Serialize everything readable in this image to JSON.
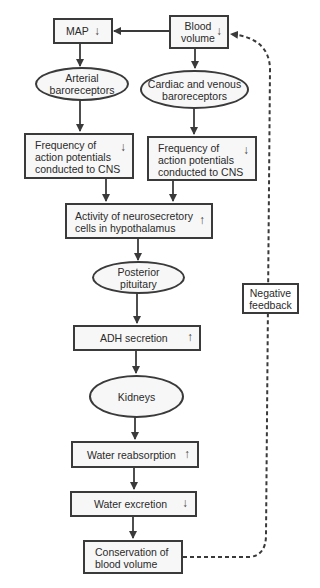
{
  "nodes": {
    "map": {
      "label": "MAP",
      "direction": "down"
    },
    "blood_volume": {
      "label_line1": "Blood",
      "label_line2": "volume",
      "direction": "down"
    },
    "arterial_baroreceptors": {
      "line1": "Arterial",
      "line2": "baroreceptors"
    },
    "cardiac_venous_baroreceptors": {
      "line1": "Cardiac and venous",
      "line2": "baroreceptors"
    },
    "freq_left": {
      "line1": "Frequency of",
      "line2": "action potentials",
      "line3": "conducted to CNS",
      "direction": "down"
    },
    "freq_right": {
      "line1": "Frequency of",
      "line2": "action potentials",
      "line3": "conducted to CNS",
      "direction": "down"
    },
    "neurosecretory": {
      "line1": "Activity of neurosecretory",
      "line2": "cells in hypothalamus",
      "direction": "up"
    },
    "posterior_pituitary": {
      "line1": "Posterior",
      "line2": "pituitary"
    },
    "adh_secretion": {
      "label": "ADH secretion",
      "direction": "up"
    },
    "kidneys": {
      "label": "Kidneys"
    },
    "water_reabsorption": {
      "label": "Water reabsorption",
      "direction": "up"
    },
    "water_excretion": {
      "label": "Water excretion",
      "direction": "down"
    },
    "conservation": {
      "line1": "Conservation of",
      "line2": "blood volume"
    },
    "negative_feedback": {
      "line1": "Negative",
      "line2": "feedback"
    }
  },
  "glyphs": {
    "up": "↑",
    "down": "↓"
  },
  "colors": {
    "stroke": "#3a3a3a",
    "fill": "#f7f7f7"
  }
}
